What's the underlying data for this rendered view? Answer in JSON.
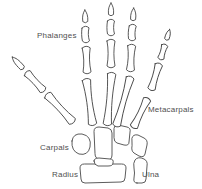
{
  "diagram": {
    "type": "hand-skeleton-line-drawing",
    "background_color": "#ffffff",
    "ink_color": "#4a4a4a",
    "text_color": "#4f4f4f",
    "labels": {
      "phalanges": "Phalanges",
      "metacarpals": "Metacarpals",
      "carpals": "Carpals",
      "radius": "Radius",
      "ulna": "Ulna"
    }
  }
}
